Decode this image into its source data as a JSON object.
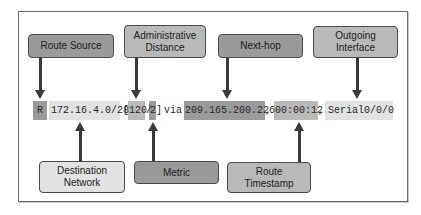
{
  "diagram": {
    "title": "",
    "route_entry": {
      "source_code": "R",
      "destination": "172.16.4.0/28",
      "open_bracket": "[",
      "admin_distance": "120",
      "slash": "/",
      "metric": "2",
      "close_bracket": "]",
      "via": "via",
      "next_hop": "209.165.200.226",
      "comma1": ",",
      "timestamp": "00:00:12",
      "comma2": ",",
      "interface": "Serial0/0/0"
    },
    "labels_top": [
      {
        "id": "route-source",
        "text": "Route Source"
      },
      {
        "id": "admin-distance",
        "text": "Administrative Distance"
      },
      {
        "id": "next-hop",
        "text": "Next-hop"
      },
      {
        "id": "outgoing-interface",
        "text": "Outgoing Interface"
      }
    ],
    "labels_bottom": [
      {
        "id": "destination-network",
        "text": "Destination Network"
      },
      {
        "id": "metric",
        "text": "Metric"
      },
      {
        "id": "route-timestamp",
        "text": "Route Timestamp"
      }
    ],
    "colors": {
      "dark_gray": "#9a9a9a",
      "mid_gray": "#b9b9b9",
      "light_gray": "#e2e2e2",
      "arrow": "#3a3a3a",
      "frame_border": "#6b6b6b"
    }
  }
}
